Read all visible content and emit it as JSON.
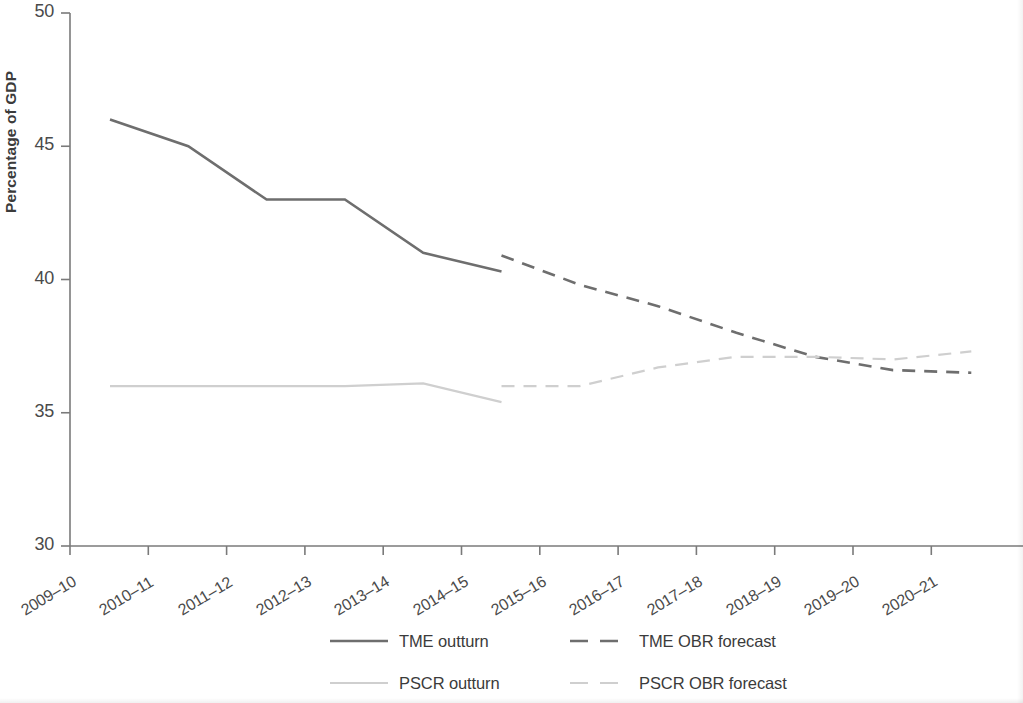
{
  "chart_data": {
    "type": "line",
    "title": "",
    "xlabel": "",
    "ylabel": "Percentage of GDP",
    "ylim": [
      30,
      50
    ],
    "yticks": [
      30,
      35,
      40,
      45,
      50
    ],
    "ytick_labels": [
      "30",
      "35",
      "40",
      "45",
      "50"
    ],
    "grid": false,
    "legend_position": "bottom",
    "categories": [
      "2009–10",
      "2010–11",
      "2011–12",
      "2012–13",
      "2013–14",
      "2014–15",
      "2015–16",
      "2016–17",
      "2017–18",
      "2018–19",
      "2019–20",
      "2020–21"
    ],
    "series": [
      {
        "name": "TME outturn",
        "style": "solid",
        "color": "#6e6e6e",
        "x": [
          "2009–10",
          "2010–11",
          "2011–12",
          "2012–13",
          "2013–14",
          "2014–15"
        ],
        "values": [
          46.0,
          45.0,
          43.0,
          43.0,
          41.0,
          40.3
        ]
      },
      {
        "name": "TME OBR forecast",
        "style": "dashed",
        "color": "#6e6e6e",
        "x": [
          "2014–15",
          "2015–16",
          "2016–17",
          "2017–18",
          "2018–19",
          "2019–20",
          "2020–21"
        ],
        "values": [
          40.9,
          39.8,
          39.0,
          38.0,
          37.1,
          36.6,
          36.5
        ]
      },
      {
        "name": "PSCR outturn",
        "style": "solid",
        "color": "#cfcfcf",
        "x": [
          "2009–10",
          "2010–11",
          "2011–12",
          "2012–13",
          "2013–14",
          "2014–15"
        ],
        "values": [
          36.0,
          36.0,
          36.0,
          36.0,
          36.1,
          35.4
        ]
      },
      {
        "name": "PSCR OBR forecast",
        "style": "dashed",
        "color": "#cfcfcf",
        "x": [
          "2014–15",
          "2015–16",
          "2016–17",
          "2017–18",
          "2018–19",
          "2019–20",
          "2020–21"
        ],
        "values": [
          36.0,
          36.0,
          36.7,
          37.1,
          37.1,
          37.0,
          37.3
        ]
      }
    ]
  },
  "axis": {
    "ylabel": "Percentage of GDP",
    "ytick_labels": [
      "50",
      "45",
      "40",
      "35",
      "30"
    ],
    "xtick_labels": [
      "2009–10",
      "2010–11",
      "2011–12",
      "2012–13",
      "2013–14",
      "2014–15",
      "2015–16",
      "2016–17",
      "2017–18",
      "2018–19",
      "2019–20",
      "2020–21"
    ]
  },
  "legend": {
    "items": [
      {
        "label": "TME outturn",
        "style": "solid",
        "color": "#6e6e6e"
      },
      {
        "label": "TME OBR forecast",
        "style": "dashed",
        "color": "#6e6e6e"
      },
      {
        "label": "PSCR outturn",
        "style": "solid",
        "color": "#cfcfcf"
      },
      {
        "label": "PSCR OBR forecast",
        "style": "dashed",
        "color": "#cfcfcf"
      }
    ]
  },
  "colors": {
    "tme": "#6e6e6e",
    "pscr": "#cfcfcf",
    "axis": "#7a7a7a",
    "text": "#3b3b3b"
  }
}
